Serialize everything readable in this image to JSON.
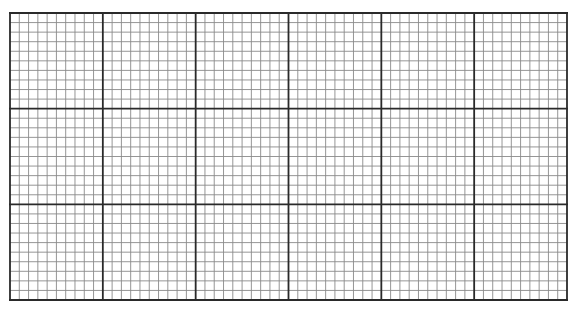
{
  "graph_paper": {
    "major_columns": 6,
    "major_rows": 3,
    "minor_per_major": 10,
    "colors": {
      "background": "#ffffff",
      "major_line": "#2a2a2a",
      "minor_line": "#8a8a8a"
    }
  }
}
